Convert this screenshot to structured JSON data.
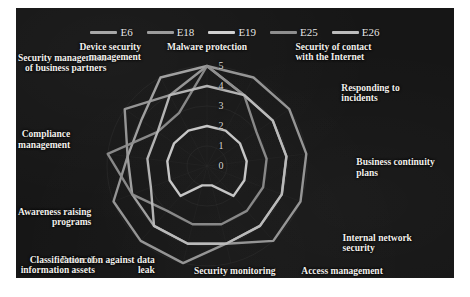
{
  "panel": {
    "background_color": "#161616",
    "text_color": "#f2f0ec"
  },
  "legend": {
    "position": "top-center",
    "items": [
      {
        "label": "E6",
        "color": "#a8a8a8"
      },
      {
        "label": "E18",
        "color": "#9c9c9c"
      },
      {
        "label": "E19",
        "color": "#d0d0d0"
      },
      {
        "label": "E25",
        "color": "#8e8e8e"
      },
      {
        "label": "E26",
        "color": "#bcbcbc"
      }
    ]
  },
  "chart_data": {
    "type": "radar",
    "title": "",
    "subtitle": "",
    "xlabel": "",
    "ylabel": "",
    "grid": true,
    "legend_position": "top",
    "rlim": [
      0,
      5
    ],
    "rticks": [
      0,
      1,
      2,
      3,
      4,
      5
    ],
    "rtick_labels": [
      "0",
      "1",
      "2",
      "3",
      "4",
      "5"
    ],
    "categories": [
      "Malware protection",
      "Security of contact\nwith the Internet",
      "Responding to\nincidents",
      "Business continuity\nplans",
      "Internal network\nsecurity",
      "Access management",
      "Security monitoring",
      "Protection against data\nleak",
      "Classification of\ninformation assets",
      "Awareness raising\nprograms",
      "Compliance\nmanagement",
      "Security management\nof business partners",
      "Device security\nmanagement"
    ],
    "series": [
      {
        "name": "E6",
        "color": "#a8a8a8",
        "values": [
          5,
          4,
          4,
          4,
          4,
          4,
          4,
          4,
          4,
          4,
          4,
          4,
          5
        ]
      },
      {
        "name": "E18",
        "color": "#9c9c9c",
        "values": [
          5,
          5,
          5,
          5,
          5,
          5,
          4,
          5,
          5,
          5,
          4,
          5,
          4
        ]
      },
      {
        "name": "E19",
        "color": "#d0d0d0",
        "values": [
          2,
          2,
          2,
          2,
          2,
          2,
          1,
          1,
          2,
          2,
          2,
          2,
          2
        ]
      },
      {
        "name": "E25",
        "color": "#8e8e8e",
        "values": [
          5,
          4,
          3,
          3,
          3,
          3,
          3,
          3,
          3,
          4,
          5,
          3,
          3
        ]
      },
      {
        "name": "E26",
        "color": "#bcbcbc",
        "values": [
          4,
          4,
          4,
          4,
          4,
          4,
          4,
          4,
          4,
          3,
          3,
          3,
          4
        ]
      }
    ]
  },
  "axis_tick_labels": [
    "5",
    "4",
    "3",
    "2",
    "1",
    "0"
  ],
  "category_labels": {
    "c0": "Malware protection",
    "c1": "Security of contact\nwith the Internet",
    "c2": "Responding to\nincidents",
    "c3": "Business continuity\nplans",
    "c4": "Internal network\nsecurity",
    "c5": "Access management",
    "c6": "Security monitoring",
    "c7": "Protection against data\nleak",
    "c8": "Classification of\ninformation assets",
    "c9": "Awareness raising\nprograms",
    "c10": "Compliance\nmanagement",
    "c11": "Security management\nof business partners",
    "c12": "Device security\nmanagement"
  }
}
